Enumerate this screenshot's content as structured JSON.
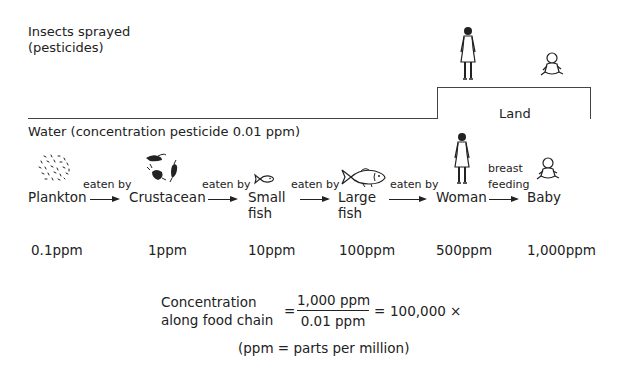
{
  "header": {
    "insects_line1": "Insects sprayed",
    "insects_line2": "(pesticides)",
    "water_label": "Water (concentration pesticide 0.01 ppm)",
    "land_label": "Land"
  },
  "chain": {
    "nodes": [
      {
        "label": "Plankton",
        "label2": "",
        "ppm": "0.1ppm",
        "icon": "plankton-icon"
      },
      {
        "label": "Crustacean",
        "label2": "",
        "ppm": "1ppm",
        "icon": "crustacean-icon"
      },
      {
        "label": "Small",
        "label2": "fish",
        "ppm": "10ppm",
        "icon": "small-fish-icon"
      },
      {
        "label": "Large",
        "label2": "fish",
        "ppm": "100ppm",
        "icon": "large-fish-icon"
      },
      {
        "label": "Woman",
        "label2": "",
        "ppm": "500ppm",
        "icon": "woman-icon"
      },
      {
        "label": "Baby",
        "label2": "",
        "ppm": "1,000ppm",
        "icon": "baby-icon"
      }
    ],
    "links": [
      {
        "label": "eaten by",
        "label2": ""
      },
      {
        "label": "eaten by",
        "label2": ""
      },
      {
        "label": "eaten by",
        "label2": ""
      },
      {
        "label": "eaten by",
        "label2": ""
      },
      {
        "label": "breast",
        "label2": "feeding"
      }
    ]
  },
  "formula": {
    "lhs_line1": "Concentration",
    "lhs_line2": "along food chain",
    "equals": "=",
    "numerator": "1,000 ppm",
    "denominator": "0.01 ppm",
    "equals2": "=",
    "result": "100,000 ×",
    "note": "(ppm = parts per million)"
  }
}
